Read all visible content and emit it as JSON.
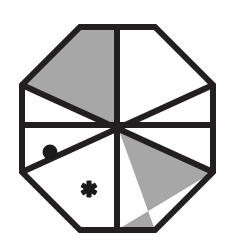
{
  "figure": {
    "title": "Octagon divided into eight wedges",
    "shape_name": "octagon",
    "wedge_count": 8,
    "canvas": {
      "width": 232,
      "height": 243,
      "background": "#ffffff"
    },
    "colors": {
      "outline": "#231f20",
      "shaded_fill": "#a7a7a7",
      "unshaded_fill": "#ffffff",
      "marker": "#1a1a1a"
    },
    "geometry": {
      "center_x": 117,
      "center_y": 125,
      "top_y": 27,
      "bottom_y": 230,
      "left_x": 22,
      "right_x": 213,
      "corner_cut": 58,
      "outline_width": 6
    },
    "wedges": [
      {
        "id": "wedge-n-nw",
        "position": "north-northwest",
        "fill": "shaded",
        "marker": "none"
      },
      {
        "id": "wedge-n-ne",
        "position": "north-northeast",
        "fill": "unshaded",
        "marker": "none"
      },
      {
        "id": "wedge-e-ne",
        "position": "east-northeast",
        "fill": "unshaded",
        "marker": "none"
      },
      {
        "id": "wedge-e-se",
        "position": "east-southeast",
        "fill": "unshaded",
        "marker": "none"
      },
      {
        "id": "wedge-s-se",
        "position": "south-southeast",
        "fill": "shaded",
        "marker": "none"
      },
      {
        "id": "wedge-s-sw",
        "position": "south-southwest",
        "fill": "unshaded",
        "marker": "asterisk"
      },
      {
        "id": "wedge-w-sw",
        "position": "west-southwest",
        "fill": "unshaded",
        "marker": "dot"
      },
      {
        "id": "wedge-w-nw",
        "position": "west-northwest",
        "fill": "unshaded",
        "marker": "none"
      }
    ],
    "markers": {
      "dot": {
        "glyph": "●",
        "label": "dot",
        "cx": 50,
        "cy": 152,
        "r": 7.5
      },
      "asterisk": {
        "glyph": "✱",
        "label": "asterisk",
        "cx": 89,
        "cy": 189,
        "size": 17
      }
    }
  }
}
